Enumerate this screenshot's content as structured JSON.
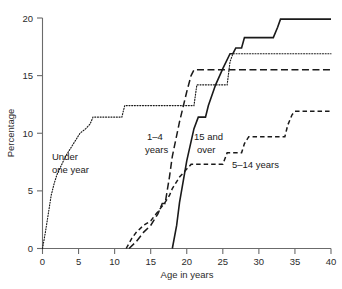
{
  "chart_data": {
    "type": "line",
    "title": "",
    "subtitle": "",
    "xlabel": "Age in years",
    "ylabel": "Percentage",
    "xlim": [
      0,
      40
    ],
    "ylim": [
      0,
      20
    ],
    "xticks": [
      0,
      5,
      10,
      15,
      20,
      25,
      30,
      35,
      40
    ],
    "yticks": [
      0,
      5,
      10,
      15,
      20
    ],
    "grid": false,
    "legend_position": "inline-annotations",
    "step_style": "post",
    "series": [
      {
        "name": "Under one year",
        "line_style": "dotted",
        "label": "Under one year",
        "label_line1": "Under",
        "label_line2": "one year",
        "x": [
          0,
          0.4,
          0.8,
          1.2,
          1.6,
          2.0,
          2.6,
          3.2,
          4.0,
          4.6,
          5.2,
          6.0,
          6.6,
          7.0,
          8.0,
          9.0,
          10.0,
          11.0,
          11.4,
          12.0,
          15.0,
          17.0,
          18.0,
          18.4,
          20.0,
          21.0,
          21.4,
          23.0,
          25.0,
          25.6,
          26.0,
          26.4,
          28.0,
          30.0,
          35.0,
          40.0
        ],
        "y": [
          0,
          1.4,
          3.0,
          4.6,
          5.6,
          6.4,
          7.2,
          8.0,
          8.8,
          9.4,
          10.0,
          10.4,
          10.8,
          11.4,
          11.4,
          11.4,
          11.4,
          11.4,
          12.4,
          12.4,
          12.4,
          12.4,
          12.4,
          12.4,
          12.4,
          12.4,
          14.2,
          14.2,
          14.2,
          14.2,
          16.2,
          16.9,
          16.9,
          16.9,
          16.9,
          16.9
        ]
      },
      {
        "name": "1-4 years",
        "line_style": "long-dash",
        "label": "1–4 years",
        "label_line1": "1–4",
        "label_line2": "years",
        "x": [
          12.0,
          13.0,
          14.0,
          15.0,
          16.0,
          16.6,
          17.0,
          17.6,
          18.0,
          19.0,
          20.0,
          20.6,
          21.0,
          25.0,
          30.0,
          35.0,
          40.0
        ],
        "y": [
          0,
          0.6,
          1.4,
          2.0,
          3.0,
          3.9,
          3.9,
          6.2,
          8.0,
          11.0,
          13.6,
          15.0,
          15.5,
          15.5,
          15.5,
          15.5,
          15.5
        ]
      },
      {
        "name": "15 and over",
        "line_style": "solid",
        "label": "15 and over",
        "label_line1": "15 and",
        "label_line2": "over",
        "x": [
          18.0,
          18.6,
          19.0,
          20.0,
          21.0,
          21.6,
          22.0,
          22.6,
          23.0,
          24.0,
          25.0,
          26.0,
          26.4,
          26.8,
          27.0,
          27.6,
          28.0,
          32.0,
          32.6,
          33.0,
          40.0
        ],
        "y": [
          0,
          2.0,
          4.0,
          7.6,
          10.4,
          11.4,
          11.4,
          11.4,
          12.4,
          14.2,
          15.6,
          16.9,
          16.9,
          17.4,
          17.4,
          17.4,
          18.3,
          18.3,
          19.2,
          19.9,
          19.9
        ]
      },
      {
        "name": "5-14 years",
        "line_style": "short-dash",
        "label": "5–14 years",
        "label_line1": "5–14 years",
        "label_line2": "",
        "x": [
          11.6,
          12.4,
          13.0,
          14.0,
          15.0,
          16.0,
          17.0,
          17.6,
          18.0,
          19.0,
          20.0,
          20.6,
          21.0,
          24.0,
          25.0,
          25.6,
          26.0,
          27.6,
          28.0,
          28.6,
          29.0,
          33.6,
          34.0,
          34.6,
          35.0,
          40.0
        ],
        "y": [
          0,
          0.9,
          1.4,
          2.0,
          2.4,
          3.2,
          4.0,
          4.6,
          5.2,
          6.2,
          6.9,
          7.3,
          7.3,
          7.3,
          7.3,
          8.3,
          8.3,
          8.3,
          9.1,
          9.7,
          9.7,
          9.7,
          10.7,
          11.6,
          11.9,
          11.9
        ]
      }
    ]
  },
  "axes": {
    "x_tick_labels": [
      "0",
      "5",
      "10",
      "15",
      "20",
      "25",
      "30",
      "35",
      "40"
    ],
    "y_tick_labels": [
      "0",
      "5",
      "10",
      "15",
      "20"
    ],
    "x_title": "Age in years",
    "y_title": "Percentage"
  },
  "annotations": [
    {
      "id": "under-one-year",
      "line1": "Under",
      "line2": "one year"
    },
    {
      "id": "one-to-four-years",
      "line1": "1–4",
      "line2": "years"
    },
    {
      "id": "fifteen-and-over",
      "line1": "15 and",
      "line2": "over"
    },
    {
      "id": "five-to-fourteen-years",
      "line1": "5–14 years",
      "line2": ""
    }
  ],
  "colors": {
    "background": "#ffffff",
    "axis": "#6b6b6b",
    "curve": "#1a1a1a",
    "text": "#2b2b2b"
  }
}
